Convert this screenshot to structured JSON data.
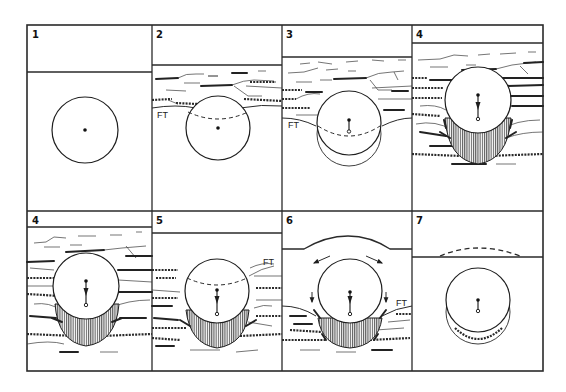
{
  "figure": {
    "panels": [
      {
        "id": "p1",
        "label": "1",
        "annotation": ""
      },
      {
        "id": "p2",
        "label": "2",
        "annotation": "FT"
      },
      {
        "id": "p3",
        "label": "3",
        "annotation": "FT"
      },
      {
        "id": "p4a",
        "label": "4",
        "annotation": ""
      },
      {
        "id": "p4b",
        "label": "4",
        "annotation": ""
      },
      {
        "id": "p5",
        "label": "5",
        "annotation": "FT"
      },
      {
        "id": "p6",
        "label": "6",
        "annotation": "FT"
      },
      {
        "id": "p7",
        "label": "7",
        "annotation": ""
      }
    ],
    "legend": {
      "ft_abbrev": "FT"
    },
    "colors": {
      "ink": "#1e1e1e",
      "background": "#ffffff"
    }
  }
}
